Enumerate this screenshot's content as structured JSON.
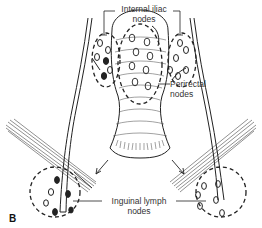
{
  "figure": {
    "panel_label": "B",
    "labels": {
      "internal_iliac": {
        "line1": "Internal iliac",
        "line2": "nodes"
      },
      "perirectal": {
        "line1": "Perirectal",
        "line2": "nodes"
      },
      "inguinal": {
        "line1": "Inguinal lymph",
        "line2": "nodes"
      }
    },
    "colors": {
      "line": "#222222",
      "background": "#ffffff"
    }
  }
}
